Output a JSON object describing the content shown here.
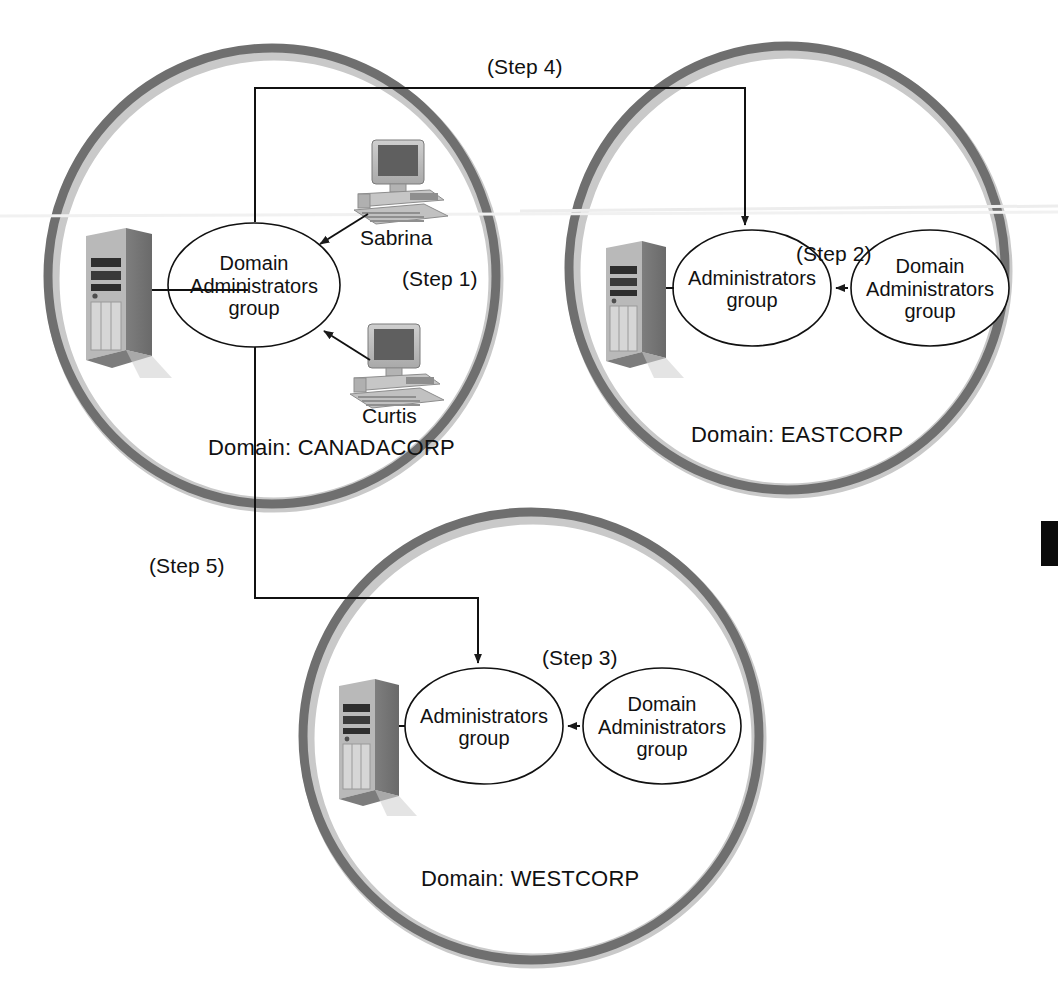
{
  "diagram": {
    "type": "network-domain-diagram",
    "colors": {
      "ring_outer": "#6f6f6f",
      "ring_inner_shadow": "#c3c3c3",
      "line": "#1a1a1a",
      "text": "#111111",
      "page_tab": "#0b0b0b"
    },
    "domains": [
      {
        "id": "canadacorp",
        "label": "Domain: CANADACORP",
        "groups": [
          {
            "id": "canada-domain-admins",
            "line1": "Domain",
            "line2": "Administrators",
            "line3": "group"
          }
        ],
        "users": [
          {
            "id": "sabrina",
            "label": "Sabrina",
            "icon": "workstation-icon"
          },
          {
            "id": "curtis",
            "label": "Curtis",
            "icon": "workstation-icon"
          }
        ],
        "server": {
          "id": "canadacorp-server",
          "icon": "server-tower-icon"
        },
        "step": {
          "id": "step1",
          "label": "(Step 1)"
        }
      },
      {
        "id": "eastcorp",
        "label": "Domain: EASTCORP",
        "groups": [
          {
            "id": "east-administrators",
            "line1": "Administrators",
            "line2": "group",
            "line3": ""
          },
          {
            "id": "east-domain-admins",
            "line1": "Domain",
            "line2": "Administrators",
            "line3": "group"
          }
        ],
        "users": [],
        "server": {
          "id": "eastcorp-server",
          "icon": "server-tower-icon"
        },
        "step": {
          "id": "step2",
          "label": "(Step 2)"
        }
      },
      {
        "id": "westcorp",
        "label": "Domain: WESTCORP",
        "groups": [
          {
            "id": "west-administrators",
            "line1": "Administrators",
            "line2": "group",
            "line3": ""
          },
          {
            "id": "west-domain-admins",
            "line1": "Domain",
            "line2": "Administrators",
            "line3": "group"
          }
        ],
        "users": [],
        "server": {
          "id": "westcorp-server",
          "icon": "server-tower-icon"
        },
        "step": {
          "id": "step3",
          "label": "(Step 3)"
        }
      }
    ],
    "connectors": [
      {
        "id": "step4",
        "label": "(Step 4)",
        "from": "canada-domain-admins",
        "to": "east-administrators"
      },
      {
        "id": "step5",
        "label": "(Step 5)",
        "from": "canada-domain-admins",
        "to": "west-administrators"
      }
    ],
    "page_tab": {
      "id": "page-edge-tab",
      "label": ""
    }
  }
}
